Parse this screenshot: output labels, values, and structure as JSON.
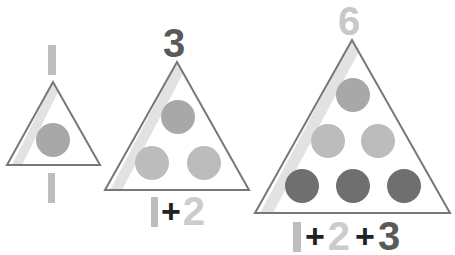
{
  "colors": {
    "background": "#ffffff",
    "triangle_stroke": "#777777",
    "triangle_fill": "#ffffff",
    "stripe": "#e2e2e2",
    "circle_mid": "#a8a8a8",
    "circle_light": "#bcbcbc",
    "circle_dark": "#6f6f6f",
    "text_one": "#bdbdbd",
    "text_two": "#cccccc",
    "text_three": "#5a5a5a",
    "text_six": "#c8c8c8",
    "text_plus": "#222222"
  },
  "triangles": [
    {
      "id": "small",
      "total_label": "1",
      "sum_parts": [
        "1"
      ],
      "dots_per_row": [
        1
      ]
    },
    {
      "id": "medium",
      "total_label": "3",
      "sum_parts": [
        "1",
        "+",
        "2"
      ],
      "dots_per_row": [
        1,
        2
      ]
    },
    {
      "id": "large",
      "total_label": "6",
      "sum_parts": [
        "1",
        "+",
        "2",
        "+",
        "3"
      ],
      "dots_per_row": [
        1,
        2,
        3
      ]
    }
  ]
}
